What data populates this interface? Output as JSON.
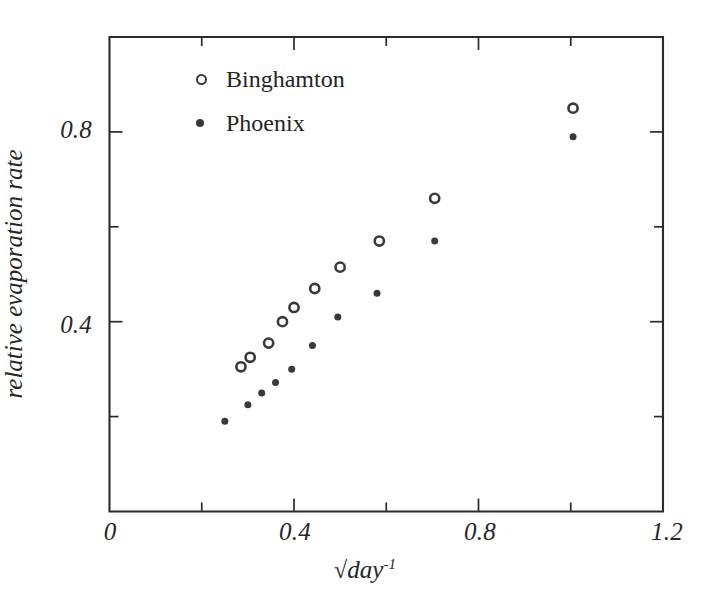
{
  "chart_data": {
    "type": "scatter",
    "title": "",
    "xlabel": "√dayCOMPOSED",
    "xlabel_parts": {
      "radical": "√",
      "base": "day",
      "exponent": "-1"
    },
    "ylabel": "relative evaporation rate",
    "xlim": [
      0,
      1.2
    ],
    "ylim": [
      0,
      1.0
    ],
    "xticks": [
      0,
      0.2,
      0.4,
      0.6,
      0.8,
      1.0,
      1.2
    ],
    "xtick_labels": [
      "0",
      "",
      "0.4",
      "",
      "0.8",
      "",
      "1.2"
    ],
    "yticks": [
      0.2,
      0.4,
      0.6,
      0.8
    ],
    "ytick_labels": [
      "",
      "0.4",
      "",
      "0.8"
    ],
    "grid": false,
    "legend_position": "upper-left-inside",
    "series": [
      {
        "name": "Binghamton",
        "marker": "open-circle",
        "color": "#3a3a3c",
        "points": [
          {
            "x": 0.285,
            "y": 0.305
          },
          {
            "x": 0.305,
            "y": 0.325
          },
          {
            "x": 0.345,
            "y": 0.355
          },
          {
            "x": 0.375,
            "y": 0.4
          },
          {
            "x": 0.4,
            "y": 0.43
          },
          {
            "x": 0.445,
            "y": 0.47
          },
          {
            "x": 0.5,
            "y": 0.515
          },
          {
            "x": 0.585,
            "y": 0.57
          },
          {
            "x": 0.705,
            "y": 0.66
          },
          {
            "x": 1.005,
            "y": 0.85
          }
        ]
      },
      {
        "name": "Phoenix",
        "marker": "filled-circle",
        "color": "#3a3a3c",
        "points": [
          {
            "x": 0.25,
            "y": 0.19
          },
          {
            "x": 0.3,
            "y": 0.225
          },
          {
            "x": 0.33,
            "y": 0.25
          },
          {
            "x": 0.36,
            "y": 0.272
          },
          {
            "x": 0.395,
            "y": 0.3
          },
          {
            "x": 0.44,
            "y": 0.35
          },
          {
            "x": 0.495,
            "y": 0.41
          },
          {
            "x": 0.58,
            "y": 0.46
          },
          {
            "x": 0.705,
            "y": 0.57
          },
          {
            "x": 1.005,
            "y": 0.79
          }
        ]
      }
    ]
  },
  "legend": {
    "entries": [
      {
        "label": "Binghamton",
        "marker": "open-circle"
      },
      {
        "label": "Phoenix",
        "marker": "filled-circle"
      }
    ]
  },
  "axes": {
    "x_tick_labels": [
      {
        "value": 0,
        "text": "0"
      },
      {
        "value": 0.4,
        "text": "0.4"
      },
      {
        "value": 0.8,
        "text": "0.8"
      },
      {
        "value": 1.2,
        "text": "1.2"
      }
    ],
    "y_tick_labels": [
      {
        "value": 0.4,
        "text": "0.4"
      },
      {
        "value": 0.8,
        "text": "0.8"
      }
    ],
    "x_title_radical": "√",
    "x_title_base": "day",
    "x_title_exponent": "-1",
    "y_title": "relative evaporation rate"
  },
  "colors": {
    "ink": "#2b2b2b",
    "marker": "#3a3a3c",
    "background": "#ffffff"
  }
}
